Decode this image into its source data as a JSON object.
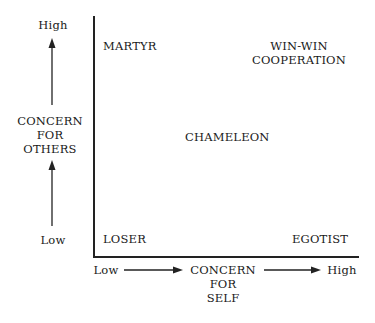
{
  "y_axis": {
    "high_label": "High",
    "low_label": "Low",
    "title_lines": [
      "CONCERN",
      "FOR",
      "OTHERS"
    ]
  },
  "x_axis": {
    "low_label": "Low",
    "high_label": "High",
    "title_lines": [
      "CONCERN",
      "FOR",
      "SELF"
    ]
  },
  "quadrants": {
    "top_left": "MARTYR",
    "top_right_lines": [
      "WIN-WIN",
      "COOPERATION"
    ],
    "center": "CHAMELEON",
    "bottom_left": "LOSER",
    "bottom_right": "EGOTIST"
  },
  "colors": {
    "ink": "#1a1a1a",
    "background": "#ffffff"
  }
}
